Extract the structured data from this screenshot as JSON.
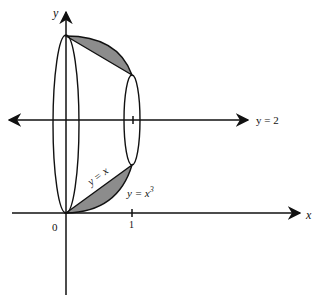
{
  "figure": {
    "type": "solid-of-revolution",
    "colors": {
      "stroke": "#111111",
      "shade": "#8c8c8c",
      "background": "#ffffff"
    }
  },
  "labels": {
    "y_axis": "y",
    "x_axis": "x",
    "axis_of_rotation": "y = 2",
    "origin": "0",
    "x_tick_1": "1",
    "curve_line": "y = x",
    "curve_cubic_base": "y = x",
    "curve_cubic_exp": "3"
  }
}
